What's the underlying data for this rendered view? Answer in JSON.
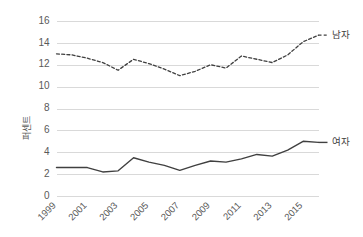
{
  "chart_data": {
    "type": "line",
    "title": "",
    "xlabel": "",
    "ylabel": "퍼센트",
    "ylim": [
      0,
      16
    ],
    "ytick_values": [
      0,
      2,
      4,
      6,
      8,
      10,
      12,
      14,
      16
    ],
    "ytick_labels": [
      "0",
      "2",
      "4",
      "6",
      "8",
      "10",
      "12",
      "14",
      "16"
    ],
    "grid": "horizontal",
    "legend_position": "right-of-line-end",
    "x": [
      1999,
      2000,
      2001,
      2002,
      2003,
      2004,
      2005,
      2006,
      2007,
      2008,
      2009,
      2010,
      2011,
      2012,
      2013,
      2014,
      2015,
      2016
    ],
    "xtick_values": [
      1999,
      2001,
      2003,
      2005,
      2007,
      2009,
      2011,
      2013,
      2015
    ],
    "xtick_labels": [
      "1999",
      "2001",
      "2003",
      "2005",
      "2007",
      "2009",
      "2011",
      "2013",
      "2015"
    ],
    "series": [
      {
        "name": "남자",
        "style": "dashed",
        "color": "#404040",
        "values": [
          13.0,
          12.9,
          12.6,
          12.2,
          11.5,
          12.5,
          12.1,
          11.6,
          11.0,
          11.4,
          12.0,
          11.7,
          12.8,
          12.5,
          12.2,
          12.9,
          14.1,
          14.7
        ]
      },
      {
        "name": "여자",
        "style": "solid",
        "color": "#404040",
        "values": [
          2.6,
          2.6,
          2.6,
          2.2,
          2.3,
          3.5,
          3.1,
          2.8,
          2.35,
          2.8,
          3.2,
          3.1,
          3.4,
          3.8,
          3.65,
          4.2,
          5.0,
          4.9
        ]
      }
    ]
  },
  "legend": {
    "male_label": "남자",
    "female_label": "여자"
  },
  "axes": {
    "y_title": "퍼센트"
  }
}
